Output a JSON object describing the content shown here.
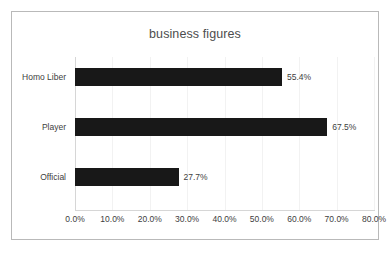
{
  "chart_data": {
    "type": "bar",
    "orientation": "horizontal",
    "title": "business figures",
    "xlabel": "",
    "ylabel": "",
    "categories": [
      "Homo Liber",
      "Player",
      "Official"
    ],
    "values": [
      55.4,
      67.5,
      27.7
    ],
    "data_labels": [
      "55.4%",
      "67.5%",
      "27.7%"
    ],
    "xlim": [
      0,
      80
    ],
    "xticks": [
      0,
      10,
      20,
      30,
      40,
      50,
      60,
      70,
      80
    ],
    "xtick_labels": [
      "0.0%",
      "10.0%",
      "20.0%",
      "30.0%",
      "40.0%",
      "50.0%",
      "60.0%",
      "70.0%",
      "80.0%"
    ],
    "grid": true,
    "grid_axis": "x",
    "legend": false,
    "series": [
      {
        "name": "business figures",
        "values": [
          55.4,
          67.5,
          27.7
        ],
        "color": "#181818"
      }
    ],
    "colors": {
      "bar": "#181818",
      "text": "#404040",
      "title_text": "#4d4d4d",
      "gridline": "#f2f2f2",
      "axis": "#d6d6d6",
      "border": "#b9b9b9",
      "background": "#ffffff"
    }
  }
}
